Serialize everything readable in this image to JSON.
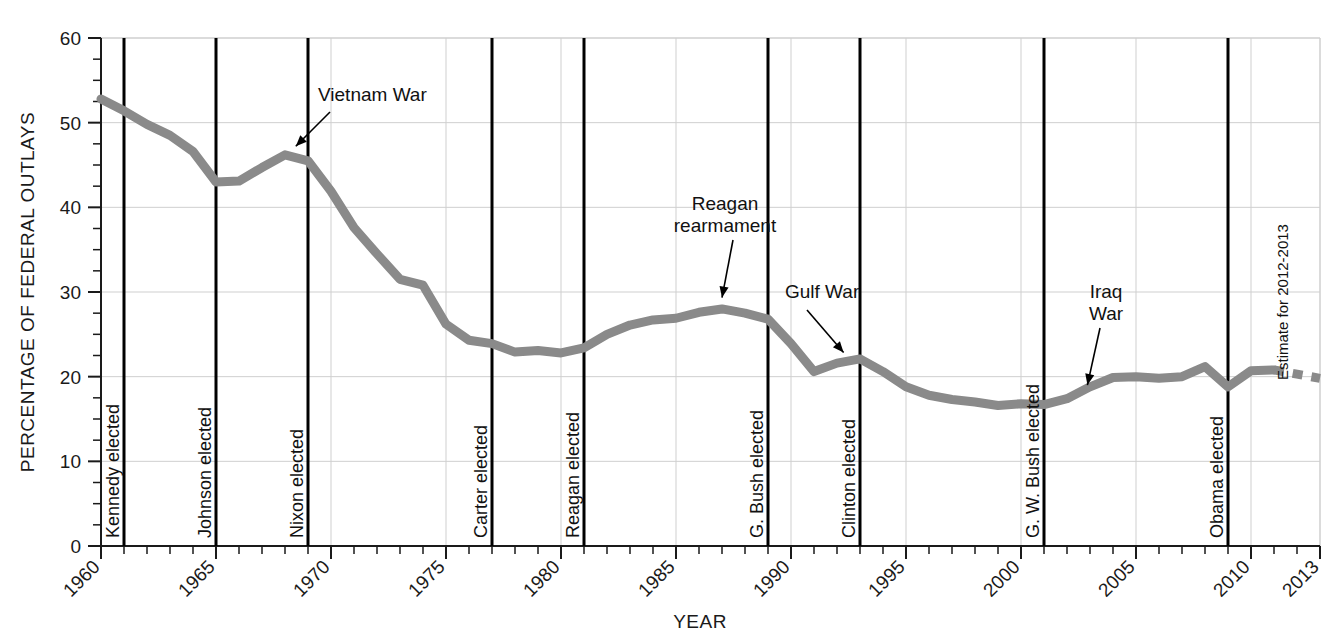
{
  "chart_data": {
    "type": "line",
    "title": "",
    "xlabel": "YEAR",
    "ylabel": "PERCENTAGE OF FEDERAL OUTLAYS",
    "xlim": [
      1960,
      2013
    ],
    "ylim": [
      0,
      60
    ],
    "grid": true,
    "legend_position": "none",
    "y_ticks": [
      0,
      10,
      20,
      30,
      40,
      50,
      60
    ],
    "y_tick_labels": [
      "0",
      "10",
      "20",
      "30",
      "40",
      "50",
      "60"
    ],
    "y_minor_tick_step": 2.5,
    "x_ticks": [
      1960,
      1965,
      1970,
      1975,
      1980,
      1985,
      1990,
      1995,
      2000,
      2005,
      2010,
      2013
    ],
    "x_tick_labels": [
      "1960",
      "1965",
      "1970",
      "1975",
      "1980",
      "1985",
      "1990",
      "1995",
      "2000",
      "2005",
      "2010",
      "2013"
    ],
    "x_minor_tick_step": 1,
    "series": [
      {
        "name": "Defense share of federal outlays",
        "style": "solid",
        "color": "#8a8a8a",
        "x": [
          1960,
          1961,
          1962,
          1963,
          1964,
          1965,
          1966,
          1967,
          1968,
          1969,
          1970,
          1971,
          1972,
          1973,
          1974,
          1975,
          1976,
          1977,
          1978,
          1979,
          1980,
          1981,
          1982,
          1983,
          1984,
          1985,
          1986,
          1987,
          1988,
          1989,
          1990,
          1991,
          1992,
          1993,
          1994,
          1995,
          1996,
          1997,
          1998,
          1999,
          2000,
          2001,
          2002,
          2003,
          2004,
          2005,
          2006,
          2007,
          2008,
          2009,
          2010,
          2011
        ],
        "y": [
          52.8,
          51.4,
          49.8,
          48.5,
          46.6,
          43.0,
          43.1,
          44.7,
          46.2,
          45.5,
          41.9,
          37.6,
          34.5,
          31.5,
          30.8,
          26.2,
          24.3,
          23.9,
          22.9,
          23.1,
          22.8,
          23.4,
          25.0,
          26.1,
          26.7,
          26.9,
          27.6,
          28.0,
          27.5,
          26.8,
          23.9,
          20.6,
          21.6,
          22.1,
          20.6,
          18.8,
          17.8,
          17.3,
          17.0,
          16.6,
          16.8,
          16.7,
          17.4,
          18.8,
          19.9,
          20.0,
          19.8,
          20.0,
          21.2,
          18.8,
          20.7,
          20.8
        ]
      },
      {
        "name": "Estimate for 2012-2013",
        "style": "dashed",
        "color": "#8a8a8a",
        "x": [
          2011,
          2012,
          2013
        ],
        "y": [
          20.8,
          20.3,
          19.8
        ]
      }
    ],
    "vertical_markers": [
      {
        "label": "Kennedy elected",
        "year": 1961
      },
      {
        "label": "Johnson elected",
        "year": 1965
      },
      {
        "label": "Nixon elected",
        "year": 1969
      },
      {
        "label": "Carter elected",
        "year": 1977
      },
      {
        "label": "Reagan elected",
        "year": 1981
      },
      {
        "label": "G. Bush elected",
        "year": 1989
      },
      {
        "label": "Clinton elected",
        "year": 1993
      },
      {
        "label": "G. W. Bush elected",
        "year": 2001
      },
      {
        "label": "Obama elected",
        "year": 2009
      }
    ],
    "annotations": [
      {
        "label": "Vietnam War",
        "lines": [
          "Vietnam War"
        ],
        "year": 1968.6,
        "value": 46.5
      },
      {
        "label": "Reagan rearmament",
        "lines": [
          "Reagan",
          "rearmament"
        ],
        "year": 1987.0,
        "value": 28.4
      },
      {
        "label": "Gulf War",
        "lines": [
          "Gulf War"
        ],
        "year": 1992.2,
        "value": 21.9
      },
      {
        "label": "Iraq War",
        "lines": [
          "Iraq",
          "War"
        ],
        "year": 2002.8,
        "value": 18.3
      },
      {
        "label": "Estimate for 2012-2013",
        "lines": [
          "Estimate for 2012-2013"
        ],
        "year": 2012.4,
        "value": 20.0
      }
    ]
  },
  "colors": {
    "line": "#8a8a8a",
    "axis": "#1a1a1a",
    "grid": "#cfcfcf",
    "marker": "#000000",
    "background": "#ffffff"
  }
}
